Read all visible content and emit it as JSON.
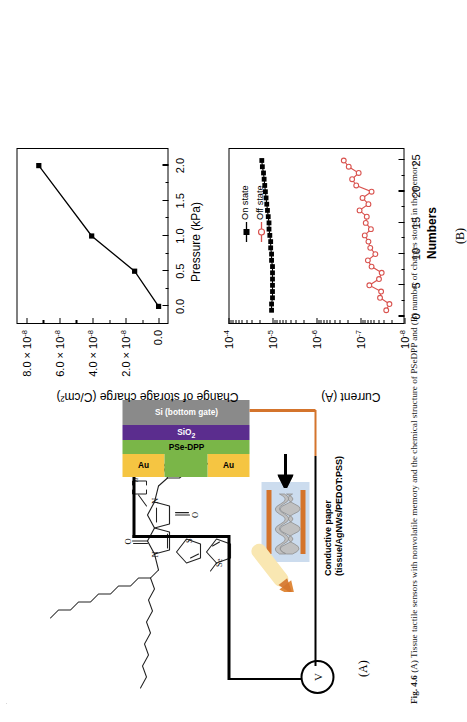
{
  "figure": {
    "number": "Fig. 4.6",
    "caption": "(A) Tissue tactile sensors with nonvolatile memory and the chemical structure of PSeDPP and (B) number of charges stored in the memory",
    "panel_a_label": "(A)",
    "panel_b_label": "(B)"
  },
  "device": {
    "meter_symbol": "V",
    "electrode_left_label": "Au",
    "electrode_right_label": "Au",
    "semiconductor_label": "PSe-DPP",
    "dielectric_label": "SiO",
    "dielectric_sub": "2",
    "substrate_label": "Si (bottom gate)",
    "paper_label_line1": "Conductive paper",
    "paper_label_line2": "(tissue/AgNWs/PEDOT:PSS)",
    "colors": {
      "gold": "#f5c542",
      "semiconductor": "#7ab648",
      "dielectric": "#5b2d8e",
      "substrate": "#8a8a8a",
      "copper": "#d4742c",
      "paper_blue": "#b9cfe8",
      "paper_gray": "#b5b5b5",
      "finger": "#f7e3a8"
    }
  },
  "chemical": {
    "name": "PSe-DPP",
    "repeat_label": "n",
    "atoms": [
      "O",
      "N",
      "N",
      "O",
      "Se",
      "Se"
    ]
  },
  "chart_data": [
    {
      "id": "charge-vs-pressure",
      "type": "line",
      "title": "",
      "xlabel": "Pressure (kPa)",
      "ylabel": "Change of storage charge (C/cm²)",
      "xlim": [
        -0.25,
        2.25
      ],
      "ylim": [
        -6e-09,
        8.6e-08
      ],
      "xticks": [
        0.0,
        0.5,
        1.0,
        1.5,
        2.0
      ],
      "xticklabels": [
        "0.0",
        "0.5",
        "1.0",
        "1.5",
        "2.0"
      ],
      "yticks": [
        0,
        2e-08,
        4e-08,
        6e-08,
        8e-08
      ],
      "yticklabels": [
        "0.0",
        "2.0 × 10⁻⁸",
        "4.0 × 10⁻⁸",
        "6.0 × 10⁻⁸",
        "8.0 × 10⁻⁸"
      ],
      "grid": false,
      "legend": "none",
      "marker": "filled-square",
      "color": "#000000",
      "x": [
        0.0,
        0.5,
        1.0,
        2.0
      ],
      "values": [
        0.0,
        1.45e-08,
        4.05e-08,
        7.25e-08
      ]
    },
    {
      "id": "endurance-on-off",
      "type": "line",
      "title": "",
      "xlabel": "Numbers",
      "ylabel": "Current (A)",
      "yscale": "log",
      "xlim": [
        -1.2,
        27
      ],
      "ylim": [
        1e-08,
        0.0001
      ],
      "xticks": [
        0,
        5,
        10,
        15,
        20,
        25
      ],
      "xticklabels": [
        "0",
        "5",
        "10",
        "15",
        "20",
        "25"
      ],
      "yticks": [
        1e-08,
        1e-07,
        1e-06,
        1e-05,
        0.0001
      ],
      "yticklabels": [
        "10⁻⁸",
        "10⁻⁷",
        "10⁻⁶",
        "10⁻⁵",
        "10⁻⁴"
      ],
      "grid": false,
      "legend": "upper-right",
      "x": [
        1,
        2,
        3,
        4,
        5,
        6,
        7,
        8,
        9,
        10,
        11,
        12,
        13,
        14,
        15,
        16,
        17,
        18,
        19,
        20,
        21,
        22,
        23,
        24,
        25
      ],
      "series": [
        {
          "name": "On state",
          "color": "#000000",
          "marker": "filled-square",
          "values": [
            1.05e-05,
            1.05e-05,
            1e-05,
            1e-05,
            1e-05,
            1e-05,
            1e-05,
            1e-05,
            1.05e-05,
            1.05e-05,
            1.1e-05,
            1.1e-05,
            1.15e-05,
            1.2e-05,
            1.2e-05,
            1.25e-05,
            1.3e-05,
            1.35e-05,
            1.4e-05,
            1.45e-05,
            1.5e-05,
            1.55e-05,
            1.6e-05,
            1.7e-05,
            1.75e-05
          ]
        },
        {
          "name": "Off state",
          "color": "#d9534f",
          "marker": "open-circle",
          "values": [
            2.6e-08,
            2.2e-08,
            3.6e-08,
            3.4e-08,
            6.3e-08,
            3.8e-08,
            3.3e-08,
            5.6e-08,
            6.8e-08,
            4.6e-08,
            6e-08,
            6.6e-08,
            8e-08,
            5.8e-08,
            7.6e-08,
            7.2e-08,
            1.05e-07,
            6.6e-08,
            9e-08,
            5.6e-08,
            1.25e-07,
            1.55e-07,
            1.1e-07,
            1.85e-07,
            2.4e-07
          ]
        }
      ]
    }
  ]
}
